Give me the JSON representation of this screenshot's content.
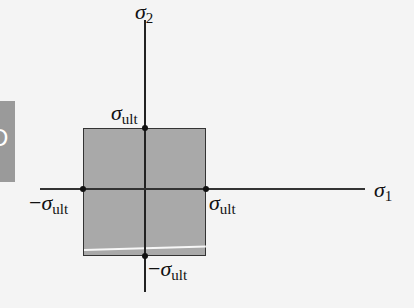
{
  "diagram": {
    "axes": {
      "horizontal": {
        "symbol": "σ",
        "subscript": "1"
      },
      "vertical": {
        "symbol": "σ",
        "subscript": "2"
      }
    },
    "points": {
      "top": {
        "sign": "",
        "symbol": "σ",
        "subscript": "ult"
      },
      "right": {
        "sign": "",
        "symbol": "σ",
        "subscript": "ult"
      },
      "left": {
        "sign": "−",
        "symbol": "σ",
        "subscript": "ult"
      },
      "bottom": {
        "sign": "−",
        "symbol": "σ",
        "subscript": "ult"
      }
    },
    "region": {
      "shape": "square",
      "fill": "#a9a9a9",
      "border": "#333333"
    },
    "side_tab": {
      "glyph": "D"
    }
  }
}
